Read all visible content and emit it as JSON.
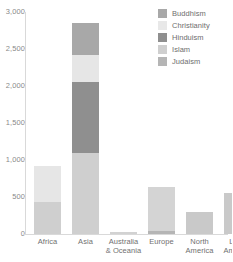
{
  "chart_data": {
    "type": "bar",
    "title": "",
    "subtitle": "",
    "xlabel": "",
    "ylabel": "",
    "stacked": true,
    "grid": false,
    "ylim": [
      0,
      3000
    ],
    "yticks": [
      0,
      500,
      1000,
      1500,
      2000,
      2500,
      3000
    ],
    "ytick_labels": [
      "0",
      "500",
      "1,000",
      "1,500",
      "2,000",
      "2,500",
      "3,000"
    ],
    "categories": [
      "Africa",
      "Asia",
      "Australia\n& Oceania",
      "Europe",
      "North\nAmerica",
      "Latin\nAmerica"
    ],
    "category_lines": [
      [
        "Africa"
      ],
      [
        "Asia"
      ],
      [
        "Australia",
        "& Oceania"
      ],
      [
        "Europe"
      ],
      [
        "North",
        "America"
      ],
      [
        "Latin",
        "America"
      ]
    ],
    "legend_position": "top-right",
    "series": [
      {
        "name": "Buddhism",
        "color": "#a8a8a8",
        "values": [
          0,
          430,
          0,
          0,
          0,
          0
        ]
      },
      {
        "name": "Christianity",
        "color": "#e6e6e6",
        "values": [
          490,
          370,
          25,
          590,
          300,
          550
        ]
      },
      {
        "name": "Hinduism",
        "color": "#8f8f8f",
        "values": [
          0,
          950,
          0,
          0,
          0,
          0
        ]
      },
      {
        "name": "Islam",
        "color": "#cfcfcf",
        "values": [
          430,
          1100,
          0,
          0,
          0,
          0
        ]
      },
      {
        "name": "Judaism",
        "color": "#b5b5b5",
        "values": [
          0,
          0,
          0,
          40,
          0,
          0
        ]
      }
    ],
    "totals": [
      920,
      2850,
      25,
      630,
      300,
      550
    ],
    "stack_order_bottom_to_top": [
      "Judaism",
      "Islam",
      "Hinduism",
      "Christianity",
      "Buddhism"
    ],
    "bar_geometry": [
      {
        "category": "Africa",
        "left": 9,
        "total": 920,
        "segments": [
          {
            "name": "Islam",
            "from": 0,
            "to": 430,
            "color": "#cfcfcf"
          },
          {
            "name": "Christianity",
            "from": 430,
            "to": 920,
            "color": "#e6e6e6"
          }
        ]
      },
      {
        "category": "Asia",
        "left": 47,
        "total": 2850,
        "segments": [
          {
            "name": "Islam",
            "from": 0,
            "to": 1100,
            "color": "#cfcfcf"
          },
          {
            "name": "Hinduism",
            "from": 1100,
            "to": 2050,
            "color": "#8f8f8f"
          },
          {
            "name": "Christianity",
            "from": 2050,
            "to": 2420,
            "color": "#e6e6e6"
          },
          {
            "name": "Buddhism",
            "from": 2420,
            "to": 2850,
            "color": "#a8a8a8"
          }
        ]
      },
      {
        "category": "Australia & Oceania",
        "left": 85,
        "total": 25,
        "segments": [
          {
            "name": "Christianity",
            "from": 0,
            "to": 25,
            "color": "#d2d2d2"
          }
        ]
      },
      {
        "category": "Europe",
        "left": 123,
        "total": 630,
        "segments": [
          {
            "name": "Judaism",
            "from": 0,
            "to": 40,
            "color": "#b5b5b5"
          },
          {
            "name": "Christianity",
            "from": 40,
            "to": 630,
            "color": "#d4d4d4"
          }
        ]
      },
      {
        "category": "North America",
        "left": 161,
        "total": 300,
        "segments": [
          {
            "name": "Christianity",
            "from": 0,
            "to": 300,
            "color": "#c9c9c9"
          }
        ]
      },
      {
        "category": "Latin America",
        "left": 199,
        "total": 550,
        "segments": [
          {
            "name": "Christianity",
            "from": 0,
            "to": 550,
            "color": "#c9c9c9"
          }
        ]
      }
    ],
    "colors": {
      "axis": "#d9d9d9",
      "tick_text": "#8a8a8a",
      "label_text": "#707070",
      "legend_text": "#6e6e6e",
      "background": "#ffffff"
    }
  },
  "legend": {
    "items": [
      {
        "label": "Buddhism",
        "color": "#a8a8a8"
      },
      {
        "label": "Christianity",
        "color": "#e8e8e8"
      },
      {
        "label": "Hinduism",
        "color": "#8f8f8f"
      },
      {
        "label": "Islam",
        "color": "#cfcfcf"
      },
      {
        "label": "Judaism",
        "color": "#b5b5b5"
      }
    ]
  }
}
